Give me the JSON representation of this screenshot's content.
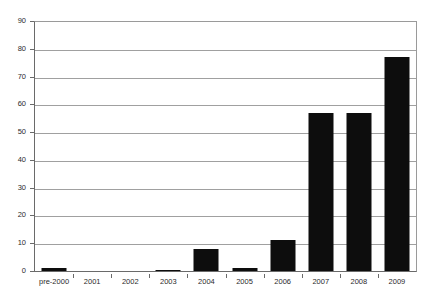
{
  "chart_data": {
    "type": "bar",
    "title": "",
    "subtitle": "",
    "xlabel": "",
    "ylabel": "",
    "categories": [
      "pre-2000",
      "2001",
      "2002",
      "2003",
      "2004",
      "2005",
      "2006",
      "2007",
      "2008",
      "2009"
    ],
    "values": [
      1,
      0,
      0,
      0.5,
      8,
      1,
      11,
      57,
      57,
      77
    ],
    "series": [
      {
        "name": "",
        "values": [
          1,
          0,
          0,
          0.5,
          8,
          1,
          11,
          57,
          57,
          77
        ]
      }
    ],
    "ylim": [
      0,
      90
    ],
    "ytick_labels": [
      "0",
      "10",
      "20",
      "30",
      "40",
      "50",
      "60",
      "70",
      "80",
      "90"
    ],
    "ytick_values": [
      0,
      10,
      20,
      30,
      40,
      50,
      60,
      70,
      80,
      90
    ],
    "grid": true,
    "grid_axis": "y",
    "legend": false,
    "legend_position": "none",
    "bar_color": "#0d0d0d",
    "gridline_color": "#a0a0a0",
    "axis_color": "#6a6a6a",
    "plot_background": "#ffffff",
    "annotations": []
  }
}
